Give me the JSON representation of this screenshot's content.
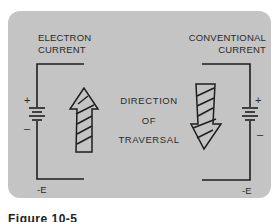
{
  "diagram": {
    "left": {
      "title_line1": "ELECTRON",
      "title_line2": "CURRENT",
      "plus": "+",
      "minus": "–",
      "terminal": "-E",
      "arrow_direction": "up"
    },
    "right": {
      "title_line1": "CONVENTIONAL",
      "title_line2": "CURRENT",
      "plus": "+",
      "minus": "–",
      "terminal": "-E",
      "arrow_direction": "down"
    },
    "center": {
      "line1": "DIRECTION",
      "line2": "OF",
      "line3": "TRAVERSAL"
    },
    "caption": "Figure 10-5"
  },
  "colors": {
    "background": "#c4c4c4",
    "ink": "#1e1e1e"
  }
}
